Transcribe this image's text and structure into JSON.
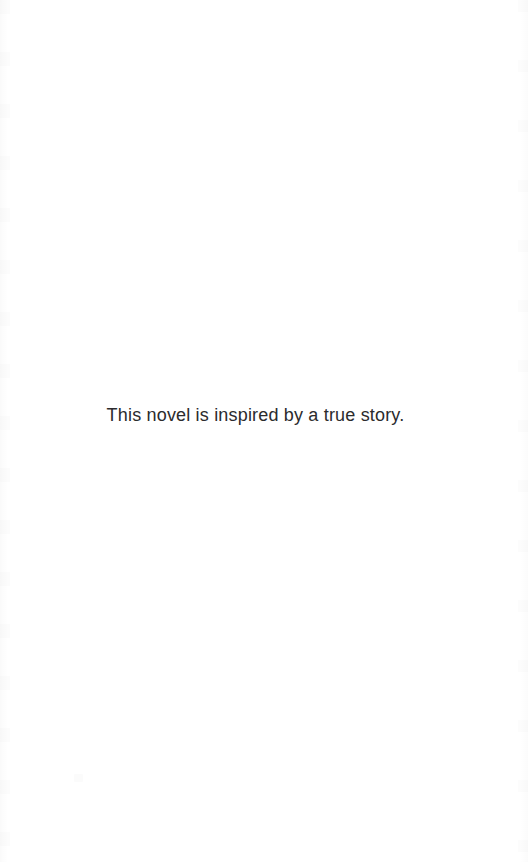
{
  "page": {
    "type": "book-front-matter-page",
    "background_color": "#ffffff",
    "width": 528,
    "height": 862
  },
  "content": {
    "epigraph": {
      "text": "This novel is inspired by a true story.",
      "color": "#2b2b2d",
      "alignment": "center"
    }
  },
  "artifacts": {
    "left_edge_label": "scan-edge-left",
    "right_edge_label": "scan-edge-right",
    "speck_label": "scan-speck"
  }
}
